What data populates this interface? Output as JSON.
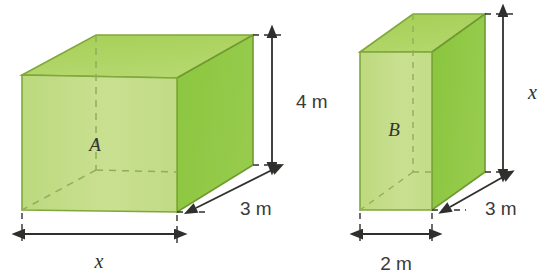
{
  "figure": {
    "background_color": "#ffffff"
  },
  "palette": {
    "front_face": "#c3dd87",
    "top_face": "#a8d05a",
    "side_face": "#8cc63f",
    "edge": "#7fa83a",
    "dark_edge": "#6f9a30",
    "dashed_hidden_edge": "#8aab55",
    "dimension_line": "#2f2f2d",
    "text": "#3a3a38"
  },
  "prisms": [
    {
      "id": "prism-a",
      "face_label": "A",
      "dimensions": {
        "width_label": "x",
        "height_label": "4 m",
        "depth_label": "3 m"
      }
    },
    {
      "id": "prism-b",
      "face_label": "B",
      "dimensions": {
        "width_label": "2 m",
        "height_label": "x",
        "depth_label": "3 m"
      }
    }
  ],
  "labels": {
    "a_face": "A",
    "a_height": "4 m",
    "a_depth": "3 m",
    "a_width": "x",
    "b_face": "B",
    "b_height": "x",
    "b_depth": "3 m",
    "b_width": "2 m"
  }
}
